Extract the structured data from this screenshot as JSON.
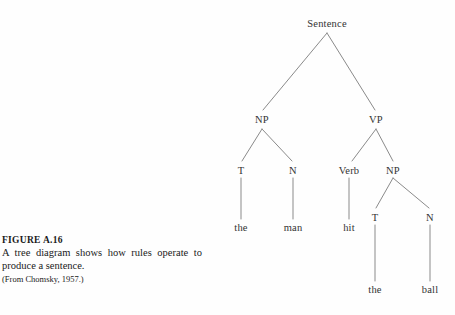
{
  "figure": {
    "title": "FIGURE A.16",
    "body": "A tree diagram shows how rules operate to produce a sentence.",
    "source": "(From Chomsky, 1957.)"
  },
  "diagram": {
    "type": "syntax-tree",
    "sentence": "the man hit the ball",
    "line_color": "#8a8a8a",
    "text_color": "#333333",
    "background": "#fefefe",
    "nodes": [
      {
        "id": "sentence",
        "label": "Sentence",
        "x": 327,
        "y": 18,
        "depth": 0
      },
      {
        "id": "np1",
        "label": "NP",
        "x": 262,
        "y": 114,
        "depth": 1
      },
      {
        "id": "vp",
        "label": "VP",
        "x": 376,
        "y": 114,
        "depth": 1
      },
      {
        "id": "t1",
        "label": "T",
        "x": 241,
        "y": 165,
        "depth": 2
      },
      {
        "id": "n1",
        "label": "N",
        "x": 293,
        "y": 165,
        "depth": 2
      },
      {
        "id": "verb",
        "label": "Verb",
        "x": 349,
        "y": 165,
        "depth": 2
      },
      {
        "id": "np2",
        "label": "NP",
        "x": 393,
        "y": 165,
        "depth": 2
      },
      {
        "id": "t2",
        "label": "T",
        "x": 375,
        "y": 212,
        "depth": 3
      },
      {
        "id": "n2",
        "label": "N",
        "x": 430,
        "y": 212,
        "depth": 3
      }
    ],
    "leaves": [
      {
        "id": "leaf-the-1",
        "label": "the",
        "x": 241,
        "y": 222,
        "parent": "t1"
      },
      {
        "id": "leaf-man",
        "label": "man",
        "x": 293,
        "y": 222,
        "parent": "n1"
      },
      {
        "id": "leaf-hit",
        "label": "hit",
        "x": 349,
        "y": 222,
        "parent": "verb"
      },
      {
        "id": "leaf-the-2",
        "label": "the",
        "x": 375,
        "y": 284,
        "parent": "t2"
      },
      {
        "id": "leaf-ball",
        "label": "ball",
        "x": 430,
        "y": 284,
        "parent": "n2"
      }
    ],
    "edges": [
      {
        "from": "sentence",
        "to": "np1"
      },
      {
        "from": "sentence",
        "to": "vp"
      },
      {
        "from": "np1",
        "to": "t1"
      },
      {
        "from": "np1",
        "to": "n1"
      },
      {
        "from": "vp",
        "to": "verb"
      },
      {
        "from": "vp",
        "to": "np2"
      },
      {
        "from": "t1",
        "to": "leaf-the-1"
      },
      {
        "from": "n1",
        "to": "leaf-man"
      },
      {
        "from": "verb",
        "to": "leaf-hit"
      },
      {
        "from": "np2",
        "to": "t2"
      },
      {
        "from": "np2",
        "to": "n2"
      },
      {
        "from": "t2",
        "to": "leaf-the-2"
      },
      {
        "from": "n2",
        "to": "leaf-ball"
      }
    ]
  }
}
